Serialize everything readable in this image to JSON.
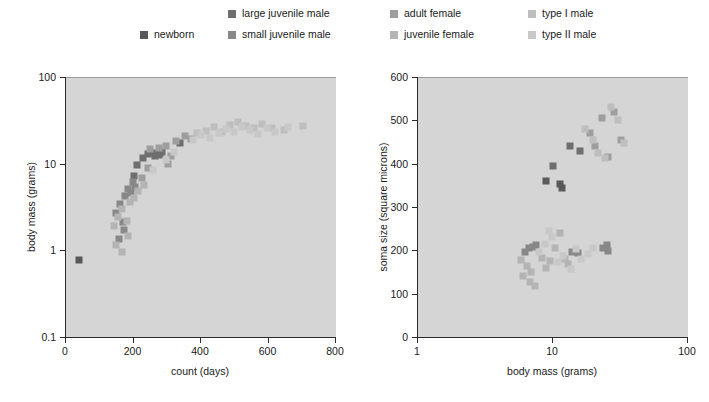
{
  "figure": {
    "background": "#ffffff",
    "plot_background": "#d5d5d5"
  },
  "legend": {
    "position": "top",
    "entries": [
      {
        "label": "newborn",
        "color": "#595959",
        "col": 0,
        "row": 1
      },
      {
        "label": "large juvenile male",
        "color": "#6e6e6e",
        "col": 1,
        "row": 0
      },
      {
        "label": "small juvenile male",
        "color": "#888888",
        "col": 1,
        "row": 1
      },
      {
        "label": "adult female",
        "color": "#9e9e9e",
        "col": 2,
        "row": 0
      },
      {
        "label": "juvenile female",
        "color": "#b4b4b4",
        "col": 2,
        "row": 1
      },
      {
        "label": "type I male",
        "color": "#bebebe",
        "col": 3,
        "row": 0
      },
      {
        "label": "type II male",
        "color": "#c8c8c8",
        "col": 3,
        "row": 1
      }
    ]
  },
  "chart_data": [
    {
      "id": "left",
      "type": "scatter",
      "title": "",
      "xlabel": "count (days)",
      "ylabel": "body mass (grams)",
      "xscale": "linear",
      "yscale": "log",
      "xlim": [
        0,
        800
      ],
      "ylim": [
        0.1,
        100
      ],
      "xticks": [
        0,
        200,
        400,
        600,
        800
      ],
      "yticks": [
        0.1,
        1,
        10,
        100
      ],
      "grid": false,
      "series": [
        {
          "name": "newborn",
          "color": "#595959",
          "points": [
            [
              40,
              0.78
            ]
          ]
        },
        {
          "name": "large juvenile male",
          "color": "#6e6e6e",
          "points": [
            [
              232,
              11.5
            ],
            [
              247,
              12.8
            ],
            [
              258,
              13.4
            ],
            [
              266,
              12.2
            ],
            [
              272,
              13.0
            ],
            [
              281,
              12.6
            ],
            [
              288,
              13.8
            ],
            [
              214,
              9.6
            ],
            [
              205,
              7.3
            ],
            [
              341,
              17.4
            ]
          ]
        },
        {
          "name": "small juvenile male",
          "color": "#888888",
          "points": [
            [
              150,
              2.7
            ],
            [
              163,
              3.4
            ],
            [
              171,
              2.1
            ],
            [
              178,
              4.2
            ],
            [
              186,
              5.1
            ],
            [
              195,
              4.6
            ],
            [
              201,
              6.2
            ],
            [
              208,
              5.4
            ],
            [
              161,
              1.35
            ],
            [
              176,
              1.7
            ]
          ]
        },
        {
          "name": "adult female",
          "color": "#9e9e9e",
          "points": [
            [
              253,
              14.6
            ],
            [
              278,
              15.2
            ],
            [
              299,
              16.1
            ],
            [
              315,
              12.4
            ],
            [
              330,
              18.2
            ],
            [
              356,
              21.0
            ],
            [
              372,
              19.4
            ],
            [
              305,
              9.8
            ],
            [
              246,
              8.9
            ],
            [
              228,
              6.8
            ]
          ]
        },
        {
          "name": "juvenile female",
          "color": "#b4b4b4",
          "points": [
            [
              146,
              1.9
            ],
            [
              158,
              2.4
            ],
            [
              169,
              3.0
            ],
            [
              183,
              2.2
            ],
            [
              192,
              3.6
            ],
            [
              205,
              4.0
            ],
            [
              217,
              4.9
            ],
            [
              233,
              5.6
            ],
            [
              152,
              1.15
            ],
            [
              170,
              0.95
            ],
            [
              188,
              1.45
            ]
          ]
        },
        {
          "name": "type I male",
          "color": "#bebebe",
          "points": [
            [
              392,
              22.5
            ],
            [
              418,
              24.0
            ],
            [
              441,
              26.5
            ],
            [
              466,
              23.0
            ],
            [
              489,
              28.0
            ],
            [
              512,
              30.5
            ],
            [
              536,
              27.0
            ],
            [
              561,
              25.5
            ],
            [
              585,
              29.0
            ],
            [
              612,
              26.0
            ],
            [
              648,
              24.5
            ],
            [
              705,
              27.5
            ]
          ]
        },
        {
          "name": "type II male",
          "color": "#c8c8c8",
          "points": [
            [
              378,
              19.0
            ],
            [
              404,
              21.5
            ],
            [
              430,
              20.0
            ],
            [
              455,
              22.8
            ],
            [
              478,
              25.0
            ],
            [
              500,
              23.5
            ],
            [
              524,
              26.8
            ],
            [
              548,
              24.2
            ],
            [
              572,
              22.0
            ],
            [
              598,
              25.8
            ],
            [
              622,
              23.0
            ],
            [
              660,
              26.2
            ],
            [
              300,
              11.0
            ],
            [
              322,
              13.5
            ],
            [
              262,
              8.4
            ]
          ]
        }
      ]
    },
    {
      "id": "right",
      "type": "scatter",
      "title": "",
      "xlabel": "body mass (grams)",
      "ylabel": "soma size (square microns)",
      "xscale": "log",
      "yscale": "linear",
      "xlim": [
        1,
        100
      ],
      "ylim": [
        0,
        600
      ],
      "xticks": [
        1,
        10,
        100
      ],
      "yticks": [
        0,
        100,
        200,
        300,
        400,
        500,
        600
      ],
      "grid": false,
      "series": [
        {
          "name": "newborn",
          "color": "#595959",
          "points": [
            [
              9.0,
              360
            ],
            [
              11.5,
              352
            ],
            [
              11.8,
              345
            ]
          ]
        },
        {
          "name": "large juvenile male",
          "color": "#6e6e6e",
          "points": [
            [
              10.2,
              395
            ],
            [
              13.5,
              440
            ],
            [
              16.2,
              430
            ]
          ]
        },
        {
          "name": "small juvenile male",
          "color": "#888888",
          "points": [
            [
              6.3,
              196
            ],
            [
              6.8,
              205
            ],
            [
              7.2,
              208
            ],
            [
              7.6,
              212
            ],
            [
              14.0,
              196
            ],
            [
              15.5,
              193
            ],
            [
              24.0,
              205
            ],
            [
              25.5,
              212
            ],
            [
              26.0,
              198
            ]
          ]
        },
        {
          "name": "adult female",
          "color": "#9e9e9e",
          "points": [
            [
              19.0,
              470
            ],
            [
              23.5,
              505
            ],
            [
              29.0,
              520
            ],
            [
              32.5,
              455
            ],
            [
              26.0,
              415
            ],
            [
              21.0,
              440
            ]
          ]
        },
        {
          "name": "juvenile female",
          "color": "#b4b4b4",
          "points": [
            [
              5.9,
              178
            ],
            [
              6.5,
              165
            ],
            [
              7.0,
              150
            ],
            [
              8.4,
              183
            ],
            [
              9.0,
              160
            ],
            [
              9.6,
              176
            ],
            [
              6.1,
              140
            ],
            [
              6.9,
              128
            ],
            [
              7.5,
              118
            ],
            [
              10.5,
              205
            ],
            [
              11.5,
              240
            ],
            [
              12.5,
              180
            ],
            [
              13.2,
              168
            ]
          ]
        },
        {
          "name": "type I male",
          "color": "#bebebe",
          "points": [
            [
              17.5,
              480
            ],
            [
              20.0,
              455
            ],
            [
              27.5,
              530
            ],
            [
              31.0,
              500
            ],
            [
              34.0,
              448
            ],
            [
              22.0,
              425
            ],
            [
              24.5,
              412
            ]
          ]
        },
        {
          "name": "type II male",
          "color": "#c8c8c8",
          "points": [
            [
              8.0,
              196
            ],
            [
              8.8,
              214
            ],
            [
              10.0,
              230
            ],
            [
              12.0,
              186
            ],
            [
              16.5,
              180
            ],
            [
              18.5,
              192
            ],
            [
              20.0,
              205
            ],
            [
              9.5,
              245
            ],
            [
              11.0,
              172
            ],
            [
              13.8,
              158
            ],
            [
              15.0,
              204
            ]
          ]
        }
      ]
    }
  ]
}
